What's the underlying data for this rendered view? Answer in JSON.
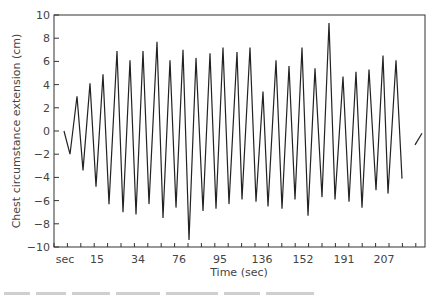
{
  "chart_data": {
    "type": "line",
    "title": "",
    "xlabel": "Time (sec)",
    "ylabel": "Chest circumstance extension (cm)",
    "ylim": [
      -10,
      10
    ],
    "yticks": [
      10,
      8,
      6,
      4,
      2,
      0,
      -2,
      -4,
      -6,
      -8,
      -10
    ],
    "xtick_labels": [
      "sec",
      "15",
      "34",
      "76",
      "95",
      "136",
      "152",
      "191",
      "207"
    ],
    "grid": false,
    "legend": null,
    "line_color": "#222222",
    "series": [
      {
        "name": "chest extension",
        "points_px_x": [
          64,
          70,
          77,
          83,
          90,
          96,
          103,
          109,
          117,
          123,
          130,
          136,
          143,
          149,
          157,
          163,
          170,
          176,
          183,
          189,
          196,
          203,
          210,
          216,
          223,
          229,
          237,
          242,
          250,
          256,
          263,
          268,
          276,
          282,
          289,
          295,
          302,
          308,
          315,
          322,
          329,
          335,
          343,
          349,
          356,
          362,
          369,
          376,
          383,
          388,
          396,
          402
        ],
        "values": [
          0,
          -2.0,
          3.0,
          -3.4,
          4.1,
          -4.8,
          4.9,
          -6.3,
          6.9,
          -7.0,
          6.1,
          -7.2,
          6.9,
          -6.3,
          7.7,
          -7.5,
          6.1,
          -6.6,
          7.0,
          -9.4,
          6.3,
          -6.9,
          6.7,
          -6.7,
          7.2,
          -6.3,
          6.8,
          -5.9,
          7.2,
          -6.1,
          3.4,
          -6.5,
          6.1,
          -6.7,
          5.6,
          -5.9,
          7.2,
          -7.3,
          5.4,
          -5.7,
          9.3,
          -5.9,
          4.7,
          -6.1,
          5.1,
          -6.6,
          5.3,
          -5.1,
          6.5,
          -5.4,
          6.1,
          -4.1
        ]
      },
      {
        "name": "trailing segment",
        "points_px_x": [
          415,
          422
        ],
        "values": [
          -1.2,
          -0.2
        ]
      }
    ]
  },
  "axes": {
    "x_title": "Time (sec)",
    "y_title": "Chest circumstance extension (cm)"
  }
}
